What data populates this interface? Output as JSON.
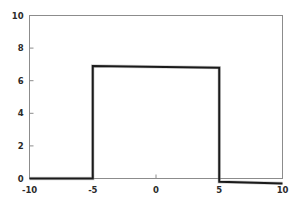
{
  "chart_data": {
    "type": "line",
    "title": "",
    "subtitle": "",
    "xlabel": "",
    "ylabel": "",
    "xlim": [
      -10,
      10
    ],
    "ylim": [
      0,
      10
    ],
    "xticks": [
      -10,
      -5,
      0,
      5,
      10
    ],
    "xticklabels": [
      "-10",
      "-5",
      "0",
      "5",
      "10"
    ],
    "yticks": [
      0,
      2,
      4,
      6,
      8,
      10
    ],
    "yticklabels": [
      "0",
      "2",
      "4",
      "6",
      "8",
      "10"
    ],
    "grid": false,
    "legend": null,
    "annotations": [],
    "series": [
      {
        "name": "rectangular pulse",
        "color": "#1a1a1a",
        "linewidth": 2,
        "x": [
          -10,
          -5,
          -5,
          5,
          5,
          10
        ],
        "values": [
          0,
          0,
          6.9,
          6.8,
          -0.2,
          -0.3
        ]
      }
    ]
  },
  "axes": {
    "frame_color": "#8c8c8c",
    "background": "#ffffff",
    "tick_color": "#8c8c8c"
  },
  "figure": {
    "background": "#ffffff"
  }
}
